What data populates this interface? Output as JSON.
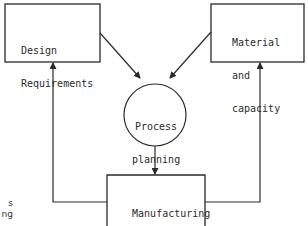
{
  "diagram": {
    "nodes": {
      "design_requirements": {
        "line1": "Design",
        "line2": "Requirements"
      },
      "material_capacity": {
        "line1": "Material",
        "line2": "and",
        "line3": "capacity"
      },
      "process_planning": {
        "line1": "Process",
        "line2": "planning"
      },
      "manufacturing": {
        "label": "Manufacturing"
      }
    },
    "edges": [
      {
        "from": "Design Requirements",
        "to": "Process planning"
      },
      {
        "from": "Material and capacity",
        "to": "Process planning"
      },
      {
        "from": "Process planning",
        "to": "Manufacturing"
      },
      {
        "from": "Manufacturing",
        "to": "Design Requirements"
      },
      {
        "from": "Manufacturing",
        "to": "Material and capacity"
      }
    ],
    "left_fragment": {
      "line1": "s",
      "line2": "ng"
    },
    "line_color": "#2a2a2a"
  }
}
